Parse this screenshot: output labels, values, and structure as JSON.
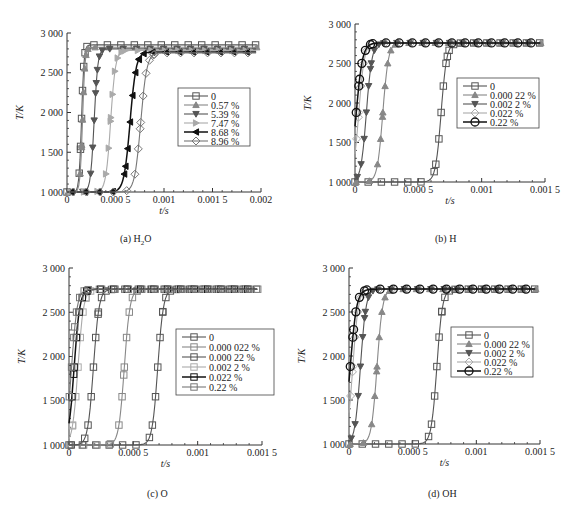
{
  "chart_data": [
    {
      "id": "a",
      "type": "line",
      "title": "(a) H2O",
      "caption": "(a) H",
      "caption_sub": "2",
      "caption_tail": "O",
      "xlabel": "t/s",
      "ylabel": "T/K",
      "xlim": [
        0,
        0.002
      ],
      "ylim": [
        1000,
        3000
      ],
      "xticks": [
        0,
        0.0005,
        0.001,
        0.0015,
        0.002
      ],
      "xtick_labels": [
        "0",
        "0.000 5",
        "0.001",
        "0.001 5",
        "0.002"
      ],
      "yticks": [
        1000,
        1500,
        2000,
        2500,
        3000
      ],
      "ytick_labels": [
        "1 000",
        "1 500",
        "2 000",
        "2 500",
        "3 000"
      ],
      "frame": {
        "x0": 67,
        "x1": 261,
        "y0": 33,
        "y1": 192
      },
      "legend": {
        "x": 178,
        "y": 88,
        "w": 72,
        "h": 58,
        "line_gap": 9
      },
      "series": [
        {
          "name": "0",
          "marker": "square",
          "color": "#555555",
          "t_ign": 0.00015,
          "T_final": 2850,
          "width": 4e-05
        },
        {
          "name": "0.57 %",
          "marker": "triangle-up",
          "color": "#888888",
          "t_ign": 0.00016,
          "T_final": 2820,
          "width": 4e-05
        },
        {
          "name": "5.39 %",
          "marker": "triangle-down",
          "color": "#555555",
          "t_ign": 0.00028,
          "T_final": 2800,
          "width": 6e-05
        },
        {
          "name": "7.47 %",
          "marker": "triangle-right",
          "color": "#aaaaaa",
          "t_ign": 0.00045,
          "T_final": 2780,
          "width": 8e-05
        },
        {
          "name": "8.68 %",
          "marker": "triangle-left",
          "color": "#111111",
          "t_ign": 0.00065,
          "T_final": 2760,
          "width": 0.0001
        },
        {
          "name": "8.96 %",
          "marker": "diamond",
          "color": "#777777",
          "t_ign": 0.00076,
          "T_final": 2750,
          "width": 0.0001
        }
      ]
    },
    {
      "id": "b",
      "type": "line",
      "title": "(b) H",
      "caption": "(b) H",
      "xlabel": "t/s",
      "ylabel": "T/K",
      "xlim": [
        0,
        0.0015
      ],
      "ylim": [
        1000,
        3000
      ],
      "xticks": [
        0,
        0.0005,
        0.001,
        0.0015
      ],
      "xtick_labels": [
        "0",
        "0.000 5",
        "0.001",
        "0.001 5"
      ],
      "yticks": [
        1000,
        1500,
        2000,
        2500,
        3000
      ],
      "ytick_labels": [
        "1 000",
        "1 500",
        "2 000",
        "2 500",
        "3 000"
      ],
      "frame": {
        "x0": 355,
        "x1": 545,
        "y0": 24,
        "y1": 182
      },
      "legend": {
        "x": 457,
        "y": 78,
        "w": 82,
        "h": 50,
        "line_gap": 9
      },
      "series": [
        {
          "name": "0",
          "marker": "square",
          "color": "#555555",
          "t_ign": 0.00068,
          "T_final": 2760,
          "width": 7e-05
        },
        {
          "name": "0.000 22 %",
          "marker": "triangle-up",
          "color": "#888888",
          "t_ign": 0.00022,
          "T_final": 2760,
          "width": 7e-05
        },
        {
          "name": "0.002 2 %",
          "marker": "triangle-down",
          "color": "#555555",
          "t_ign": 9e-05,
          "T_final": 2760,
          "width": 7e-05
        },
        {
          "name": "0.022 %",
          "marker": "diamond",
          "color": "#aaaaaa",
          "t_ign": 3e-05,
          "T_final": 2760,
          "width": 7e-05
        },
        {
          "name": "0.22 %",
          "marker": "circle",
          "color": "#111111",
          "t_ign": 1e-05,
          "T_final": 2760,
          "width": 8e-05
        }
      ]
    },
    {
      "id": "c",
      "type": "line",
      "title": "(c) O",
      "caption": "(c) O",
      "xlabel": "t/s",
      "ylabel": "T/K",
      "xlim": [
        0,
        0.0015
      ],
      "ylim": [
        1000,
        3000
      ],
      "xticks": [
        0,
        0.0005,
        0.001,
        0.0015
      ],
      "xtick_labels": [
        "0",
        "0.000 5",
        "0.001",
        "0.001 5"
      ],
      "yticks": [
        1000,
        1500,
        2000,
        2500,
        3000
      ],
      "ytick_labels": [
        "1 000",
        "1 500",
        "2 000",
        "2 500",
        "3 000"
      ],
      "frame": {
        "x0": 69,
        "x1": 262,
        "y0": 268,
        "y1": 445
      },
      "legend": {
        "x": 176,
        "y": 329,
        "w": 98,
        "h": 66,
        "line_gap": 10
      },
      "series": [
        {
          "name": "0",
          "marker": "square",
          "color": "#555555",
          "t_ign": 0.00069,
          "T_final": 2760,
          "width": 7e-05
        },
        {
          "name": "0.000 022 %",
          "marker": "square",
          "color": "#888888",
          "t_ign": 0.00043,
          "T_final": 2760,
          "width": 7e-05
        },
        {
          "name": "0.000 22 %",
          "marker": "square",
          "color": "#555555",
          "t_ign": 0.00019,
          "T_final": 2760,
          "width": 7e-05
        },
        {
          "name": "0.002 2 %",
          "marker": "square",
          "color": "#aaaaaa",
          "t_ign": 7e-05,
          "T_final": 2760,
          "width": 7e-05
        },
        {
          "name": "0.022 %",
          "marker": "square",
          "color": "#111111",
          "t_ign": 4e-05,
          "T_final": 2760,
          "width": 7e-05
        },
        {
          "name": "0.22 %",
          "marker": "square",
          "color": "#777777",
          "t_ign": 2e-05,
          "T_final": 2760,
          "width": 7e-05
        }
      ]
    },
    {
      "id": "d",
      "type": "line",
      "title": "(d) OH",
      "caption": "(d) OH",
      "xlabel": "t/s",
      "ylabel": "T/K",
      "xlim": [
        0,
        0.0015
      ],
      "ylim": [
        1000,
        3000
      ],
      "xticks": [
        0,
        0.0005,
        0.001,
        0.0015
      ],
      "xtick_labels": [
        "0",
        "0.000 5",
        "0.001",
        "0.001 5"
      ],
      "yticks": [
        1000,
        1500,
        2000,
        2500,
        3000
      ],
      "ytick_labels": [
        "1 000",
        "1 500",
        "2 000",
        "2 500",
        "3 000"
      ],
      "frame": {
        "x0": 349,
        "x1": 540,
        "y0": 268,
        "y1": 444
      },
      "legend": {
        "x": 451,
        "y": 327,
        "w": 82,
        "h": 50,
        "line_gap": 9
      },
      "series": [
        {
          "name": "0",
          "marker": "square",
          "color": "#555555",
          "t_ign": 0.00069,
          "T_final": 2760,
          "width": 7e-05
        },
        {
          "name": "0.000 22 %",
          "marker": "triangle-up",
          "color": "#888888",
          "t_ign": 0.00022,
          "T_final": 2760,
          "width": 7e-05
        },
        {
          "name": "0.002 2 %",
          "marker": "triangle-down",
          "color": "#555555",
          "t_ign": 9e-05,
          "T_final": 2760,
          "width": 7e-05
        },
        {
          "name": "0.022 %",
          "marker": "diamond",
          "color": "#aaaaaa",
          "t_ign": 3e-05,
          "T_final": 2760,
          "width": 7e-05
        },
        {
          "name": "0.22 %",
          "marker": "circle",
          "color": "#111111",
          "t_ign": 1e-05,
          "T_final": 2760,
          "width": 8e-05
        }
      ]
    }
  ],
  "captions": {
    "a": "(a) H",
    "a_sub": "2",
    "a_tail": "O",
    "b": "(b) H",
    "c": "(c) O",
    "d": "(d) OH"
  },
  "caption_positions": {
    "a": {
      "x": 150,
      "y": 242
    },
    "b": {
      "x": 447,
      "y": 242
    },
    "c": {
      "x": 160,
      "y": 497
    },
    "d": {
      "x": 440,
      "y": 497
    }
  }
}
